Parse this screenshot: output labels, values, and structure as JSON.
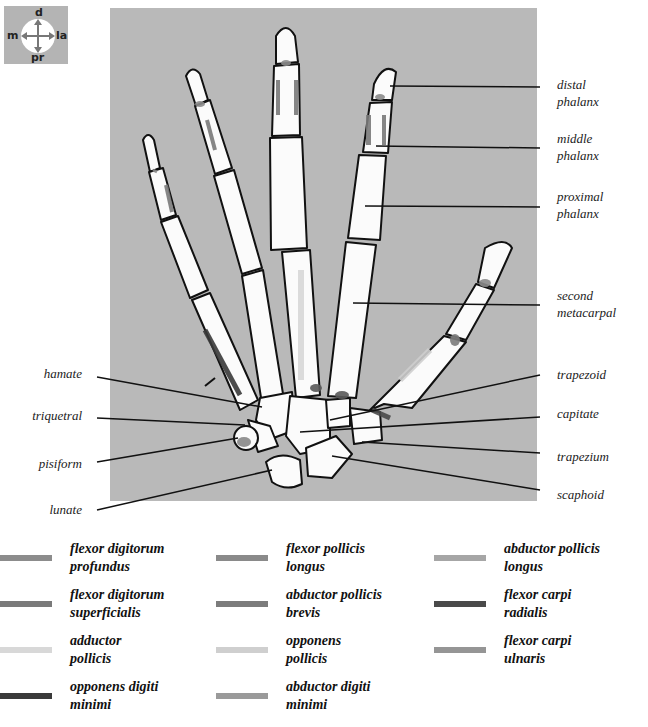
{
  "compass": {
    "top": "d",
    "bottom": "pr",
    "left": "m",
    "right": "la"
  },
  "labels_right": [
    {
      "text": "distal\nphalanx",
      "line1": "distal",
      "line2": "phalanx"
    },
    {
      "line1": "middle",
      "line2": "phalanx"
    },
    {
      "line1": "proximal",
      "line2": "phalanx"
    },
    {
      "line1": "second",
      "line2": "metacarpal"
    },
    {
      "line1": "trapezoid"
    },
    {
      "line1": "capitate"
    },
    {
      "line1": "trapezium"
    },
    {
      "line1": "scaphoid"
    }
  ],
  "labels_left": [
    {
      "line1": "hamate"
    },
    {
      "line1": "triquetral"
    },
    {
      "line1": "pisiform"
    },
    {
      "line1": "lunate"
    }
  ],
  "legend": [
    {
      "line1": "flexor digitorum",
      "line2": "profundus",
      "color": "#8c8c8c"
    },
    {
      "line1": "flexor digitorum",
      "line2": "superficialis",
      "color": "#7a7a7a"
    },
    {
      "line1": "adductor",
      "line2": "pollicis",
      "color": "#d8d8d8"
    },
    {
      "line1": "opponens digiti",
      "line2": "minimi",
      "color": "#3a3a3a"
    },
    {
      "line1": "flexor pollicis",
      "line2": "longus",
      "color": "#8a8a8a"
    },
    {
      "line1": "abductor pollicis",
      "line2": "brevis",
      "color": "#7c7c7c"
    },
    {
      "line1": "opponens",
      "line2": "pollicis",
      "color": "#cfcfcf"
    },
    {
      "line1": "abductor digiti",
      "line2": "minimi",
      "color": "#9a9a9a"
    },
    {
      "line1": "abductor pollicis",
      "line2": "longus",
      "color": "#a6a6a6"
    },
    {
      "line1": "flexor carpi",
      "line2": "radialis",
      "color": "#4a4a4a"
    },
    {
      "line1": "flexor carpi",
      "line2": "ulnaris",
      "color": "#959595"
    }
  ]
}
